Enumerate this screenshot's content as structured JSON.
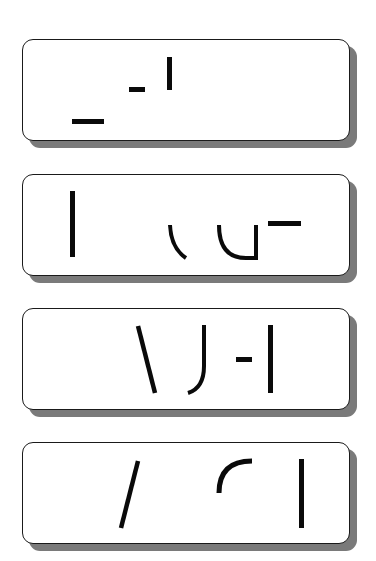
{
  "panels": [
    {
      "label": "panel-1",
      "fragments": [
        "long-dash",
        "short-dash",
        "vertical-bar"
      ]
    },
    {
      "label": "panel-2",
      "fragments": [
        "vertical-bar",
        "left-arc",
        "u-curve",
        "top-bar"
      ]
    },
    {
      "label": "panel-3",
      "fragments": [
        "backslash",
        "j-hook",
        "short-dash",
        "vertical-bar"
      ]
    },
    {
      "label": "panel-4",
      "fragments": [
        "slash",
        "top-left-arc",
        "vertical-bar"
      ]
    }
  ],
  "colors": {
    "ink": "#0a0a0a",
    "border": "#1a1a1a",
    "shadow": "#7a7a7a",
    "background": "#ffffff"
  }
}
